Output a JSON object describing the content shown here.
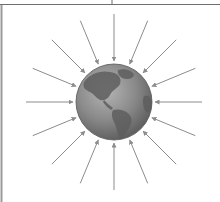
{
  "diagram": {
    "globe": {
      "center": [
        114,
        102
      ],
      "radius": 38,
      "ocean_color": "#8a8a8a",
      "land_color": "#5e5e5e",
      "highlight_color": "#b5b5b5"
    },
    "arrows": {
      "count": 16,
      "color": "#8c8c8c",
      "inner_radius": 41,
      "outer_radius": 88
    },
    "frame": {
      "top_line_color": "#6e6e6e",
      "left_border_color": "#9a9a9a"
    }
  }
}
